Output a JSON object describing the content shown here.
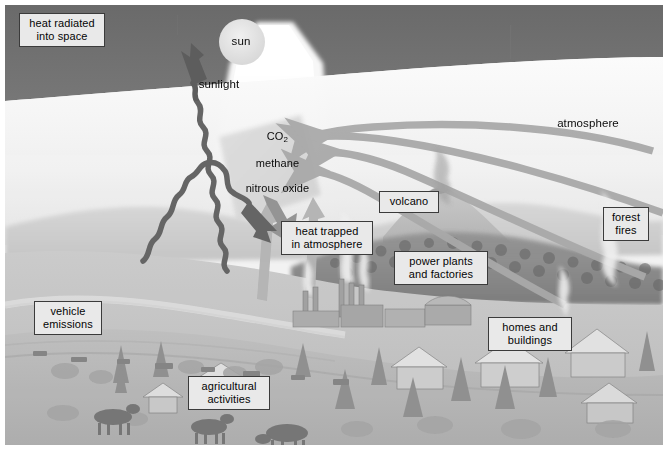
{
  "diagram": {
    "type": "illustrated-science-diagram",
    "colors": {
      "sky": "#6e6e6e",
      "atmosphere_haze": "#f4f4f4",
      "label_fill": "#e9e9e9",
      "label_border": "#3b3b3b",
      "arrow_gray": "#a8a8a8",
      "squiggle_dark": "#5d5d5d",
      "ground": "#bdbdbd",
      "page_background": "#ffffff"
    }
  },
  "labels": {
    "heat_radiated": "heat radiated\ninto space",
    "sun": "sun",
    "sunlight": "sunlight",
    "greenhouse_gases_line1": "CO",
    "greenhouse_gases_sub": "2",
    "greenhouse_gases_line2": "methane",
    "greenhouse_gases_line3": "nitrous oxide",
    "atmosphere": "atmosphere",
    "volcano": "volcano",
    "forest_fires": "forest\nfires",
    "heat_trapped": "heat trapped\nin atmosphere",
    "power_plants": "power plants\nand factories",
    "homes_buildings": "homes and\nbuildings",
    "vehicle_emissions": "vehicle\nemissions",
    "agricultural": "agricultural\nactivities"
  },
  "scene_elements": {
    "sky_band": "dark gray upper sky",
    "sun_disc": "pale circle upper center",
    "sunlight_beam": "white wedge from sun down to ground",
    "gas_band": "light gray angled band holding greenhouse gas names",
    "outgoing_squiggle": "dark wavy arrow up-left to space",
    "reflected_squiggle": "dark wavy arrow bouncing back down",
    "curved_arrows": "four long gray curved arrows sweeping right-to-left",
    "upward_arrows": "three short gray arrows rising from the valley",
    "landscape": "hills, forested ridge, river valley",
    "smokestacks": "industrial plumes left of center",
    "volcano_plume": "ash plume at center ridge",
    "forest_fire_plume": "smoke plume at right ridge",
    "houses": "suburban homes lower right",
    "road_traffic": "line of vehicles lower left",
    "cattle": "three grazing cattle bottom left"
  }
}
